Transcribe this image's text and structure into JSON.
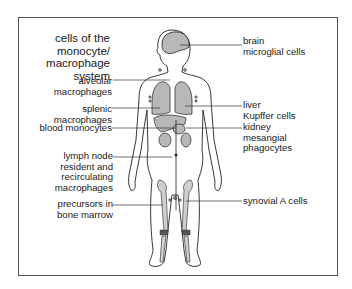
{
  "diagram": {
    "title": "cells of the\nmonocyte/\nmacrophage\nsystem",
    "colors": {
      "organ_fill": "#b8b8b8",
      "outline": "#222222",
      "leader_line": "#333333",
      "frame": "#555555"
    },
    "labels_left": [
      {
        "id": "alveolar",
        "text": "alveolar\nmacrophages",
        "target": "lung"
      },
      {
        "id": "splenic",
        "text": "splenic\nmacrophages",
        "target": "spleen"
      },
      {
        "id": "blood",
        "text": "blood monocytes",
        "target": "blood vessel"
      },
      {
        "id": "lymph",
        "text": "lymph node\nresident and\nrecirculating\nmacrophages",
        "target": "lymph node"
      },
      {
        "id": "precursors",
        "text": "precursors in\nbone marrow",
        "target": "bone marrow"
      }
    ],
    "labels_right": [
      {
        "id": "brain",
        "text": "brain\nmicroglial cells",
        "target": "brain"
      },
      {
        "id": "liver",
        "text": "liver\nKupffer cells",
        "target": "liver"
      },
      {
        "id": "kidney",
        "text": "kidney\nmesangial\nphagocytes",
        "target": "kidney"
      },
      {
        "id": "synovial",
        "text": "synovial A cells",
        "target": "knee joint"
      }
    ]
  }
}
